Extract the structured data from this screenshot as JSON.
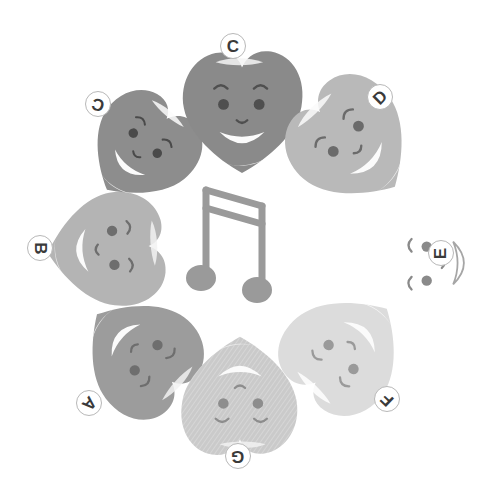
{
  "scene": {
    "title": "Seven smiling blob characters in a ring around a musical note",
    "background_color": "#ffffff",
    "center_icon": {
      "name": "beamed-eighth-notes-icon",
      "glyph": "♫",
      "color": "#9a9a9a",
      "x": 186,
      "y": 182,
      "width": 100,
      "height": 122
    }
  },
  "characters": [
    {
      "id": "A",
      "label": "A",
      "fill": "#9c9c9c",
      "highlight": "#f2f2f2",
      "feature_color": "#6e6e6e",
      "x": 78,
      "y": 291,
      "size": 126,
      "rotation": 132,
      "label_x": 76,
      "label_y": 390,
      "label_rotation": 132,
      "textured": false
    },
    {
      "id": "B",
      "label": "B",
      "fill": "#b4b4b4",
      "highlight": "#f2f2f2",
      "feature_color": "#6e6e6e",
      "x": 44,
      "y": 186,
      "size": 126,
      "rotation": 86,
      "label_x": 27,
      "label_y": 235,
      "label_rotation": 90,
      "textured": false
    },
    {
      "id": "C-left",
      "label": "C",
      "fill": "#8d8d8d",
      "highlight": "#fbfbfb",
      "feature_color": "#4a4a4a",
      "x": 84,
      "y": 90,
      "size": 116,
      "rotation": 40,
      "label_x": 85,
      "label_y": 91,
      "label_rotation": 196,
      "textured": false
    },
    {
      "id": "C",
      "label": "C",
      "fill": "#8a8a8a",
      "highlight": "#f5f5f5",
      "feature_color": "#4f4f4f",
      "x": 176,
      "y": 45,
      "size": 132,
      "rotation": 0,
      "label_x": 220,
      "label_y": 33,
      "label_rotation": 0,
      "textured": false
    },
    {
      "id": "D",
      "label": "D",
      "fill": "#b9b9b9",
      "highlight": "#fafafa",
      "feature_color": "#6b6b6b",
      "x": 285,
      "y": 77,
      "size": 132,
      "rotation": 315,
      "label_x": 367,
      "label_y": 84,
      "label_rotation": 315,
      "textured": false
    },
    {
      "id": "E",
      "label": "E",
      "fill": "#ffffff",
      "highlight": "#ffffff",
      "feature_color": "#8a8a8a",
      "x": 370,
      "y": 200,
      "size": 126,
      "rotation": 270,
      "label_x": 428,
      "label_y": 240,
      "label_rotation": 270,
      "textured": false
    },
    {
      "id": "F",
      "label": "F",
      "fill": "#dcdcdc",
      "highlight": "#ffffff",
      "feature_color": "#9a9a9a",
      "x": 281,
      "y": 288,
      "size": 128,
      "rotation": 224,
      "label_x": 374,
      "label_y": 386,
      "label_rotation": 224,
      "textured": false
    },
    {
      "id": "G",
      "label": "G",
      "fill": "#cacaca",
      "highlight": "#f2f2f2",
      "feature_color": "#8d8d8d",
      "x": 176,
      "y": 333,
      "size": 128,
      "rotation": 180,
      "label_x": 225,
      "label_y": 443,
      "label_rotation": 180,
      "textured": true
    }
  ]
}
